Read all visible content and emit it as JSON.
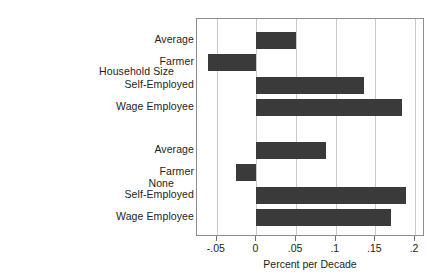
{
  "chart_data": {
    "type": "bar",
    "orientation": "horizontal",
    "title": "",
    "xlabel": "Percent per Decade",
    "ylabel": "",
    "xlim": [
      -0.075,
      0.21
    ],
    "xticks": [
      -0.05,
      0,
      0.05,
      0.1,
      0.15,
      0.2
    ],
    "xticklabels": [
      "-.05",
      "0",
      ".05",
      ".1",
      ".15",
      ".2"
    ],
    "grid": true,
    "gridlines_axis": "x",
    "legend": false,
    "bar_color": "#3a3a3a",
    "groups": [
      {
        "label": "Household Size",
        "categories": [
          "Average",
          "Farmer",
          "Self-Employed",
          "Wage Employee"
        ],
        "values": [
          0.05,
          -0.061,
          0.135,
          0.183
        ]
      },
      {
        "label": "None",
        "categories": [
          "Average",
          "Farmer",
          "Self-Employed",
          "Wage Employee"
        ],
        "values": [
          0.088,
          -0.026,
          0.188,
          0.17
        ]
      }
    ]
  }
}
